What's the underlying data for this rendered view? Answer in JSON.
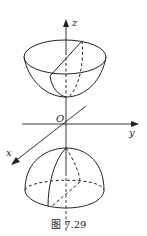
{
  "figure": {
    "caption": "图 7.29",
    "axes": {
      "z": "z",
      "y": "y",
      "x": "x",
      "origin": "O"
    },
    "ink_color": "#222222",
    "background": "#ffffff"
  }
}
